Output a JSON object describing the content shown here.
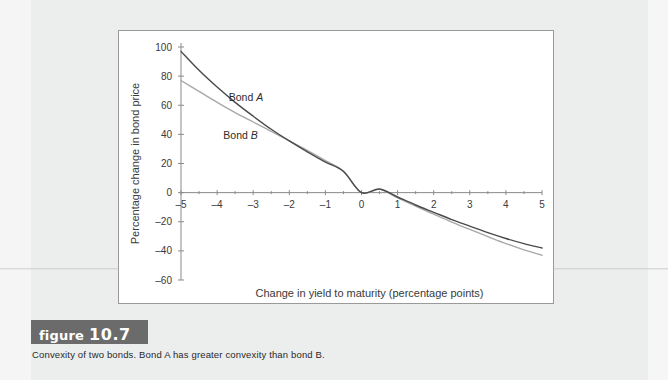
{
  "figure": {
    "tag_word": "figure",
    "number": "10.7",
    "caption": "Convexity of two bonds. Bond A has greater convexity than bond B."
  },
  "chart_data": {
    "type": "line",
    "title": "",
    "xlabel": "Change in yield to maturity (percentage points)",
    "ylabel": "Percentage change in bond price",
    "xlim": [
      -5,
      5
    ],
    "ylim": [
      -60,
      100
    ],
    "xticks": [
      -5,
      -4,
      -3,
      -2,
      -1,
      0,
      1,
      2,
      3,
      4,
      5
    ],
    "xticklabels": [
      "–5",
      "–4",
      "–3",
      "–2",
      "–1",
      "0",
      "1",
      "2",
      "3",
      "4",
      "5"
    ],
    "yticks": [
      -60,
      -40,
      -20,
      0,
      20,
      40,
      60,
      80,
      100
    ],
    "yticklabels": [
      "–60",
      "–40",
      "–20",
      "0",
      "20",
      "40",
      "60",
      "80",
      "100"
    ],
    "minor_xtick_step": 0.5,
    "grid": false,
    "legend_position": "inline-annotations",
    "x": [
      -5,
      -4.5,
      -4,
      -3.5,
      -3,
      -2.5,
      -2,
      -1.5,
      -1,
      -0.5,
      0,
      0.5,
      1,
      1.5,
      2,
      2.5,
      3,
      3.5,
      4,
      4.5,
      5
    ],
    "series": [
      {
        "name": "Bond A",
        "color": "#4a4a4a",
        "label_text": "Bond A",
        "values": [
          97,
          84,
          72.5,
          62,
          52.5,
          43.5,
          35.5,
          28,
          21,
          14.5,
          0,
          2.5,
          -3,
          -8.5,
          -13.5,
          -18.5,
          -23,
          -27.5,
          -31.5,
          -35,
          -38
        ]
      },
      {
        "name": "Bond B",
        "color": "#a8a8a8",
        "label_text": "Bond B",
        "values": [
          77,
          69.5,
          62,
          55,
          48.5,
          42,
          35.5,
          29,
          22,
          14.8,
          0,
          2.2,
          -3.6,
          -9.3,
          -14.8,
          -20.2,
          -25.3,
          -30.2,
          -35,
          -39.3,
          -43
        ]
      }
    ],
    "annotations": [
      {
        "text": "Bond A",
        "x": -3.2,
        "y": 63
      },
      {
        "text": "Bond B",
        "x": -3.35,
        "y": 37
      }
    ]
  },
  "colors": {
    "bond_a": "#4a4a4a",
    "bond_b": "#a8a8a8",
    "axis": "#8a8a8a",
    "panel_border": "#9a9a9a",
    "tag_background": "#6b6b6b",
    "page_background": "#eceded"
  }
}
